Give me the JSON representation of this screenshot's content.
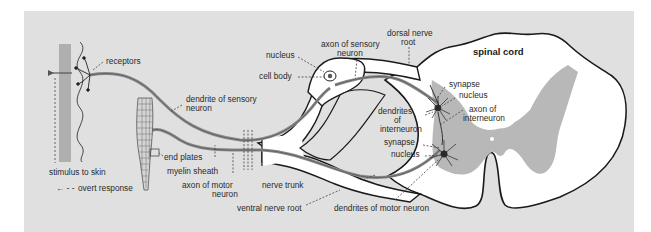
{
  "figure": {
    "title": "spinal cord",
    "colors": {
      "page_background": "#ffffff",
      "panel_background": "#e0e0e0",
      "tissue_fill": "#ffffff",
      "grey_matter": "#b8b8b8",
      "outline": "#1a1a1a",
      "nerve_fiber": "#8a8a8a"
    },
    "labels": {
      "receptors": "receptors",
      "dendrite_sensory_1": "dendrite of sensory",
      "dendrite_sensory_2": "neuron",
      "stimulus": "stimulus to skin",
      "overt_response": "overt response",
      "end_plates": "end plates",
      "myelin_sheath": "myelin sheath",
      "axon_motor_1": "axon of motor",
      "axon_motor_2": "neuron",
      "nucleus_top": "nucleus",
      "cell_body": "cell body",
      "axon_sensory_1": "axon of sensory",
      "axon_sensory_2": "neuron",
      "dorsal_root_1": "dorsal nerve",
      "dorsal_root_2": "root",
      "spinal_cord": "spinal cord",
      "synapse_1": "synapse",
      "nucleus_1": "nucleus",
      "axon_inter_1": "axon  of",
      "axon_inter_2": "interneuron",
      "dendrites_inter_1": "dendrites",
      "dendrites_inter_2": "of",
      "dendrites_inter_3": "interneuron",
      "synapse_2": "synapse",
      "nucleus_2": "nucleus",
      "nerve_trunk": "nerve trunk",
      "ventral_root": "ventral nerve root",
      "dendrites_motor": "dendrites of motor neuron"
    },
    "arrow_glyph": "← - -"
  }
}
